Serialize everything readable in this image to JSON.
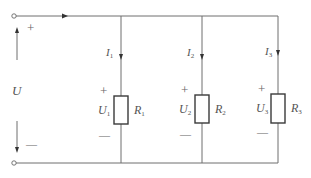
{
  "diagram": {
    "type": "parallel-resistor-circuit",
    "source": {
      "label": "U",
      "plus": "+",
      "minus": "—"
    },
    "branches": [
      {
        "current": "I",
        "current_sub": "1",
        "voltage": "U",
        "voltage_sub": "1",
        "resistor": "R",
        "resistor_sub": "1",
        "plus": "+",
        "minus": "—"
      },
      {
        "current": "I",
        "current_sub": "2",
        "voltage": "U",
        "voltage_sub": "2",
        "resistor": "R",
        "resistor_sub": "2",
        "plus": "+",
        "minus": "—"
      },
      {
        "current": "I",
        "current_sub": "3",
        "voltage": "U",
        "voltage_sub": "3",
        "resistor": "R",
        "resistor_sub": "3",
        "plus": "+",
        "minus": "—"
      }
    ],
    "colors": {
      "wire": "#6f6f6f",
      "resistor": "#3a3a3a",
      "text": "#555555"
    }
  }
}
